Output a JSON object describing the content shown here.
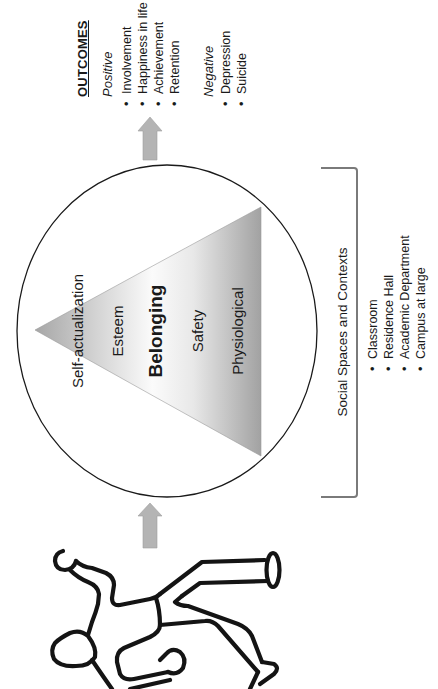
{
  "colors": {
    "stroke": "#1a1a1a",
    "arrow_fill": "#b4b4b4",
    "bracket": "#7a7a7a",
    "pyramid_dark": "#a4a4a4",
    "pyramid_light": "#fbfbfb"
  },
  "outcomes": {
    "title": "OUTCOMES",
    "positive": {
      "label": "Positive",
      "items": [
        "Involvement",
        "Happiness in life",
        "Achievement",
        "Retention"
      ]
    },
    "negative": {
      "label": "Negative",
      "items": [
        "Depression",
        "Suicide"
      ]
    }
  },
  "pyramid": {
    "levels": [
      {
        "label": "Self-actualization",
        "emphasis": false
      },
      {
        "label": "Esteem",
        "emphasis": false
      },
      {
        "label": "Belonging",
        "emphasis": true
      },
      {
        "label": "Safety",
        "emphasis": false
      },
      {
        "label": "Physiological",
        "emphasis": false
      }
    ]
  },
  "social": {
    "title": "Social Spaces and Contexts",
    "items": [
      "Classroom",
      "Residence Hall",
      "Academic Department",
      "Campus at large"
    ]
  },
  "arrows": [
    {
      "name": "context-to-outcomes",
      "direction": "up"
    },
    {
      "name": "student-to-context",
      "direction": "up"
    }
  ],
  "figure": {
    "icon": "person-figure-icon"
  }
}
